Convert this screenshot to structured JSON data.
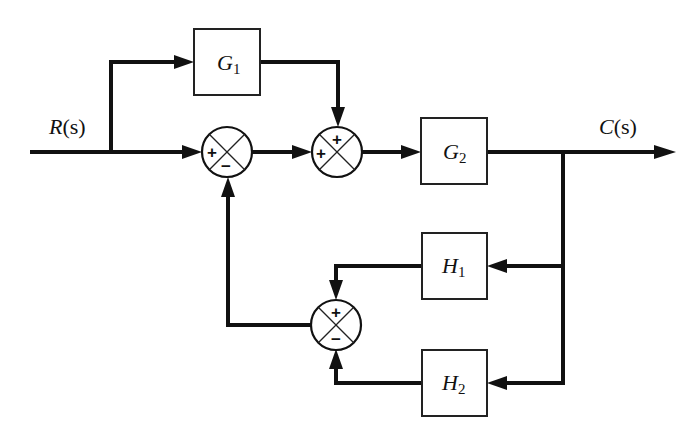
{
  "diagram": {
    "type": "control-system-block-diagram",
    "signals": {
      "input": "R(s)",
      "input_main": "R",
      "input_arg": "(s)",
      "output": "C(s)",
      "output_main": "C",
      "output_arg": "(s)"
    },
    "blocks": [
      {
        "id": "G1",
        "main": "G",
        "sub": "1"
      },
      {
        "id": "G2",
        "main": "G",
        "sub": "2"
      },
      {
        "id": "H1",
        "main": "H",
        "sub": "1"
      },
      {
        "id": "H2",
        "main": "H",
        "sub": "2"
      }
    ],
    "summing_junctions": [
      {
        "id": "S1",
        "signs": {
          "left": "+",
          "bottom": "−"
        }
      },
      {
        "id": "S2",
        "signs": {
          "left": "+",
          "top": "+"
        }
      },
      {
        "id": "S3",
        "signs": {
          "top": "+",
          "bottom": "−"
        }
      }
    ],
    "connections": [
      "R(s) → S1 (+)",
      "R(s) → G1",
      "G1 → S2 (+ top)",
      "S1 → S2 (+ left)",
      "S2 → G2",
      "G2 → C(s)",
      "C(s) → H1",
      "C(s) → H2",
      "H1 → S3 (+)",
      "H2 → S3 (−)",
      "S3 → S1 (−)"
    ]
  }
}
